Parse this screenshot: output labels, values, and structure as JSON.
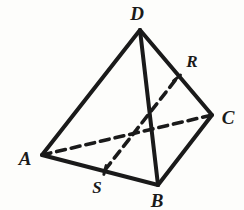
{
  "figure": {
    "type": "geometry-diagram",
    "shape_name": "tetrahedron",
    "background_color": "#fdfdfb",
    "stroke_color": "#1a1a1a",
    "solid_stroke_width": 4.0,
    "dashed_stroke_width": 3.6,
    "dash_pattern": "9 6",
    "width": 244,
    "height": 210
  },
  "vertices": [
    {
      "id": "D",
      "label": "D",
      "x": 140,
      "y": 30,
      "label_x": 137,
      "label_y": 13,
      "kind": "apex"
    },
    {
      "id": "A",
      "label": "A",
      "x": 42,
      "y": 155,
      "label_x": 25,
      "label_y": 158,
      "kind": "base"
    },
    {
      "id": "B",
      "label": "B",
      "x": 158,
      "y": 185,
      "label_x": 157,
      "label_y": 200,
      "kind": "base"
    },
    {
      "id": "C",
      "label": "C",
      "x": 212,
      "y": 115,
      "label_x": 228,
      "label_y": 117,
      "kind": "base"
    }
  ],
  "points": [
    {
      "id": "R",
      "label": "R",
      "x": 177,
      "y": 78,
      "label_x": 192,
      "label_y": 61,
      "on_edge": "DC"
    },
    {
      "id": "S",
      "label": "S",
      "x": 105,
      "y": 170,
      "label_x": 97,
      "label_y": 187,
      "on_edge": "AB"
    }
  ],
  "edges": [
    {
      "id": "DA",
      "from": "D",
      "to": "A",
      "x1": 140,
      "y1": 30,
      "x2": 42,
      "y2": 155,
      "style": "solid",
      "visibility": "visible"
    },
    {
      "id": "DB",
      "from": "D",
      "to": "B",
      "x1": 140,
      "y1": 30,
      "x2": 158,
      "y2": 185,
      "style": "solid",
      "visibility": "visible"
    },
    {
      "id": "DC",
      "from": "D",
      "to": "C",
      "x1": 140,
      "y1": 30,
      "x2": 212,
      "y2": 115,
      "style": "solid",
      "visibility": "visible"
    },
    {
      "id": "AB",
      "from": "A",
      "to": "B",
      "x1": 42,
      "y1": 155,
      "x2": 158,
      "y2": 185,
      "style": "solid",
      "visibility": "visible"
    },
    {
      "id": "BC",
      "from": "B",
      "to": "C",
      "x1": 158,
      "y1": 185,
      "x2": 212,
      "y2": 115,
      "style": "solid",
      "visibility": "visible"
    },
    {
      "id": "AC",
      "from": "A",
      "to": "C",
      "x1": 42,
      "y1": 155,
      "x2": 212,
      "y2": 115,
      "style": "dashed",
      "visibility": "hidden"
    },
    {
      "id": "SR",
      "from": "S",
      "to": "R",
      "x1": 105,
      "y1": 170,
      "x2": 177,
      "y2": 78,
      "style": "dashed",
      "visibility": "hidden"
    }
  ]
}
